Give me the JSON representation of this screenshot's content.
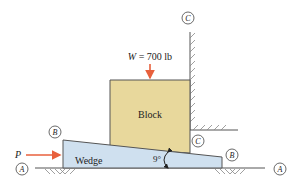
{
  "diagram": {
    "type": "wedge-block statics problem",
    "colors": {
      "block_fill": "#e8d89c",
      "wedge_fill": "#cfe0ef",
      "outline": "#444444",
      "force_arrow": "#e8603c",
      "hatch": "#777777"
    },
    "load": {
      "symbol": "W",
      "text": "W = 700 lb",
      "value": 700,
      "unit": "lb"
    },
    "push_force": {
      "symbol": "P"
    },
    "block": {
      "label": "Block"
    },
    "wedge": {
      "label": "Wedge",
      "angle_label": "9°",
      "angle_deg": 9
    },
    "surface_labels": {
      "A_left": "A",
      "A_right": "A",
      "B_left": "B",
      "B_right": "B",
      "C_top": "C",
      "C_bottom": "C"
    }
  }
}
